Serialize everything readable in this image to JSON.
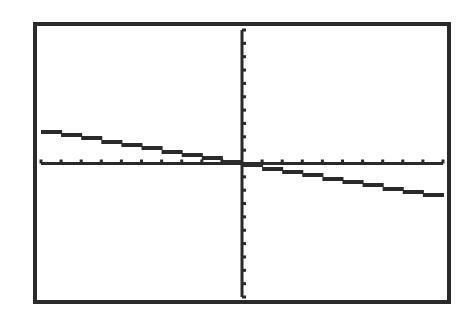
{
  "screen": {
    "background": "#ffffff",
    "ink": "#2a2a2a"
  },
  "chart_data": {
    "type": "line",
    "title": "",
    "xlabel": "",
    "ylabel": "",
    "xlim": [
      -10,
      10
    ],
    "ylim": [
      -10,
      10
    ],
    "xscl": 1,
    "yscl": 1,
    "grid": false,
    "legend": null,
    "series": [
      {
        "name": "Y1",
        "equation": "y = -0.25x",
        "x": [
          -10,
          -8,
          -6,
          -4,
          -2,
          0,
          2,
          4,
          6,
          8,
          10
        ],
        "y": [
          2.5,
          2,
          1.5,
          1,
          0.5,
          0,
          -0.5,
          -1,
          -1.5,
          -2,
          -2.5
        ]
      }
    ]
  },
  "layout": {
    "frame": {
      "x": 33,
      "y": 22,
      "w": 418,
      "h": 282,
      "stroke": 4
    },
    "plot": {
      "x0": 41,
      "x1": 443,
      "y0": 30,
      "y1": 297
    }
  }
}
